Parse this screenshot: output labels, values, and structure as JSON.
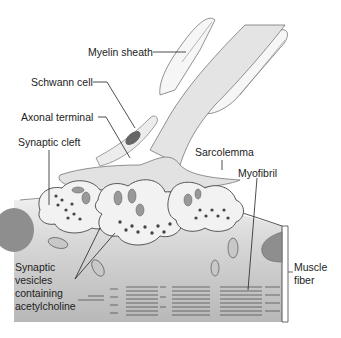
{
  "diagram": {
    "labels": {
      "myelin_sheath": "Myelin sheath",
      "schwann_cell": "Schwann cell",
      "axonal_terminal": "Axonal terminal",
      "synaptic_cleft": "Synaptic cleft",
      "sarcolemma": "Sarcolemma",
      "myofibril": "Myofibril",
      "muscle_fiber_1": "Muscle",
      "muscle_fiber_2": "fiber",
      "vesicles_1": "Synaptic",
      "vesicles_2": "vesicles",
      "vesicles_3": "containing",
      "vesicles_4": "acetylcholine"
    },
    "colors": {
      "axon_fill": "#e6e6e6",
      "myelin_fill": "#f4f4f4",
      "schwann_nucleus": "#6b6b6b",
      "muscle_fill_top": "#ededed",
      "muscle_fill_bottom": "#b9b9b9",
      "nucleus_fill": "#8f8f8f",
      "outline": "#555555",
      "vesicle": "#444444"
    }
  }
}
